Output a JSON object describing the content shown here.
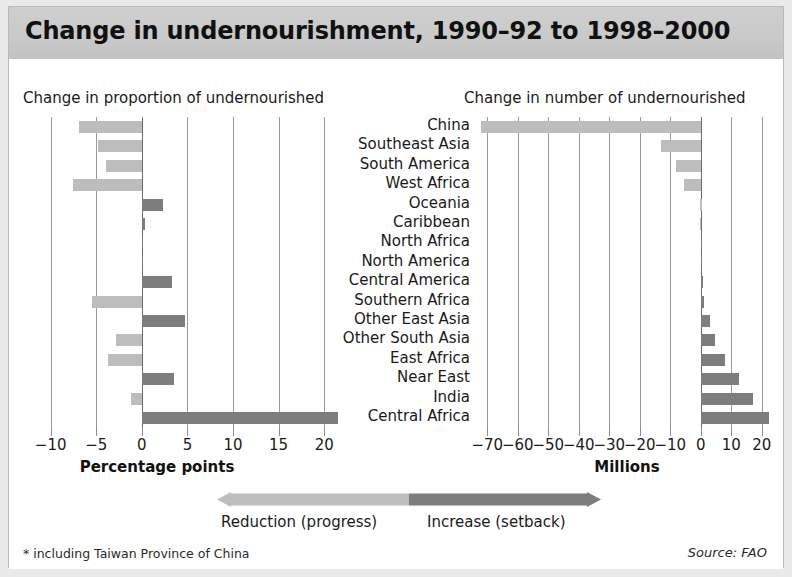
{
  "title": "Change in undernourishment, 1990–92 to 1998–2000",
  "panels": {
    "left_heading": "Change in proportion of undernourished",
    "right_heading": "Change in number of undernourished"
  },
  "legend": {
    "reduction_label": "Reduction (progress)",
    "increase_label": "Increase (setback)",
    "reduction_color": "#bdbdbd",
    "increase_color": "#7d7d7d"
  },
  "footnote": "* including Taiwan Province of China",
  "source": "Source: FAO",
  "chart_data": [
    {
      "type": "bar",
      "orientation": "horizontal",
      "title": "Change in proportion of undernourished",
      "xlabel": "Percentage points",
      "ylabel": "",
      "xlim": [
        -11.5,
        22.5
      ],
      "xticks": [
        -10,
        -5,
        0,
        5,
        10,
        15,
        20
      ],
      "xticklabels": [
        "−10",
        "−5",
        "0",
        "5",
        "10",
        "15",
        "20"
      ],
      "grid": true,
      "categories": [
        "China",
        "Southeast Asia",
        "South America",
        "West Africa",
        "Oceania",
        "Caribbean",
        "North Africa",
        "North America",
        "Central America",
        "Southern Africa",
        "Other East Asia",
        "Other South Asia",
        "East Africa",
        "Near East",
        "India",
        "Central Africa"
      ],
      "values": [
        -6.9,
        -4.8,
        -3.9,
        -7.5,
        2.3,
        0.4,
        0.1,
        0.1,
        3.3,
        -5.5,
        4.7,
        -2.8,
        -3.7,
        3.5,
        -1.2,
        21.5
      ]
    },
    {
      "type": "bar",
      "orientation": "horizontal",
      "title": "Change in number of undernourished",
      "xlabel": "Millions",
      "ylabel": "",
      "xlim": [
        -75,
        24
      ],
      "xticks": [
        -70,
        -60,
        -50,
        -40,
        -30,
        -20,
        -10,
        0,
        10,
        20
      ],
      "xticklabels": [
        "−70",
        "−60",
        "−50",
        "−40",
        "−30",
        "−20",
        "−10",
        "0",
        "10",
        "20"
      ],
      "grid": true,
      "categories": [
        "China",
        "Southeast Asia",
        "South America",
        "West Africa",
        "Oceania",
        "Caribbean",
        "North Africa",
        "North America",
        "Central America",
        "Southern Africa",
        "Other East Asia",
        "Other South Asia",
        "East Africa",
        "Near East",
        "India",
        "Central Africa"
      ],
      "values": [
        -72.0,
        -13.0,
        -8.0,
        -5.6,
        -0.2,
        -0.4,
        0.3,
        0.4,
        0.6,
        1.2,
        3.0,
        4.5,
        8.0,
        12.5,
        17.0,
        22.5
      ]
    }
  ],
  "categories": [
    "China",
    "Southeast Asia",
    "South America",
    "West Africa",
    "Oceania",
    "Caribbean",
    "North Africa",
    "North America",
    "Central America",
    "Southern Africa",
    "Other East Asia",
    "Other South Asia",
    "East Africa",
    "Near East",
    "India",
    "Central Africa"
  ]
}
